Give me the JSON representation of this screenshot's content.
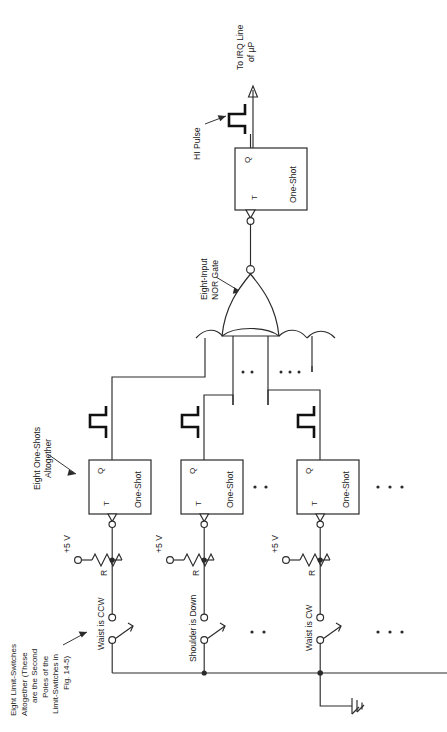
{
  "figure": {
    "orientation": "rotated-90-ccw"
  },
  "labels": {
    "irq_output": "To IRQ Line\nof µP",
    "irq_output_line1": "To IRQ Line",
    "irq_output_line2": "of µP",
    "hi_pulse": "HI Pulse",
    "nor_gate": "Eight-Input\nNOR Gate",
    "nor_gate_line1": "Eight-Input",
    "nor_gate_line2": "NOR Gate",
    "one_shots_note": "Eight One-Shots\nAltogether",
    "one_shots_note_line1": "Eight One-Shots",
    "one_shots_note_line2": "Altogether",
    "limit_switches_note_line1": "Eight Limit-Switches",
    "limit_switches_note_line2": "Altogether (These",
    "limit_switches_note_line3": "are the Second",
    "limit_switches_note_line4": "Poles of the",
    "limit_switches_note_line5": "Limit-Switches in",
    "limit_switches_note_line6": "Fig. 14-5)"
  },
  "blocks": {
    "output_one_shot": {
      "name": "One-Shot",
      "q_pin": "Q",
      "t_pin": "T"
    },
    "channel_one_shots": [
      {
        "name": "One-Shot",
        "q_pin": "Q",
        "t_pin": "T"
      },
      {
        "name": "One-Shot",
        "q_pin": "Q",
        "t_pin": "T"
      },
      {
        "name": "One-Shot",
        "q_pin": "Q",
        "t_pin": "T"
      }
    ]
  },
  "channels": [
    {
      "supply": "+5 V",
      "resistor": "R",
      "switch_label": "Waist is CCW"
    },
    {
      "supply": "+5 V",
      "resistor": "R",
      "switch_label": "Shoulder is Down"
    },
    {
      "supply": "+5 V",
      "resistor": "R",
      "switch_label": "Waist is CW"
    }
  ],
  "symbols": {
    "ground": "chassis-ground",
    "pulse_waveform": "positive-pulse",
    "trigger_bubble": "inverting-edge-trigger",
    "nor_bubble": "inversion-bubble",
    "ellipsis": "•  •"
  },
  "colors": {
    "ink": "#2b2b2b",
    "paper": "#ffffff",
    "bold_ink": "#111111"
  }
}
